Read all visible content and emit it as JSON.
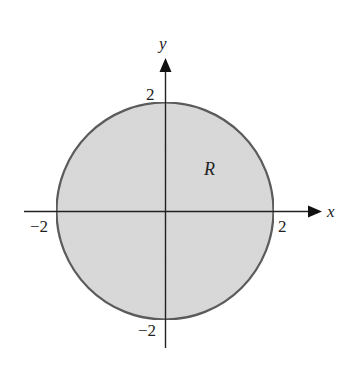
{
  "diagram": {
    "region_label": "R",
    "axes": {
      "x_label": "x",
      "y_label": "y",
      "x_ticks": [
        {
          "value": -2,
          "label": "−2"
        },
        {
          "value": 2,
          "label": "2"
        }
      ],
      "y_ticks": [
        {
          "value": 2,
          "label": "2"
        },
        {
          "value": -2,
          "label": "−2"
        }
      ]
    },
    "circle": {
      "center": [
        0,
        0
      ],
      "radius": 2
    },
    "colors": {
      "fill": "#d9d9d9",
      "stroke": "#555555",
      "axis": "#222222"
    }
  }
}
